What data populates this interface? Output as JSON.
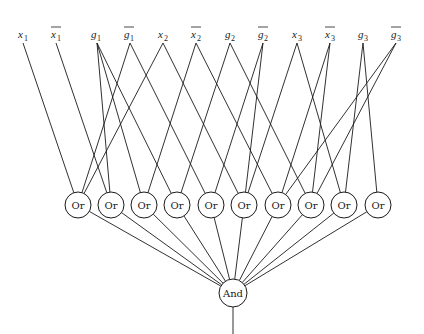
{
  "diagram": {
    "type": "boolean-circuit",
    "stroke_color": "#1a1a1a",
    "background": "#ffffff",
    "inputs": [
      {
        "id": "x1",
        "base": "x",
        "sub": "1",
        "negated": false,
        "x": 23,
        "label_x": 22
      },
      {
        "id": "nx1",
        "base": "x",
        "sub": "1",
        "negated": true,
        "x": 56,
        "label_x": 55
      },
      {
        "id": "g1",
        "base": "g",
        "sub": "1",
        "negated": false,
        "x": 97,
        "label_x": 95
      },
      {
        "id": "ng1",
        "base": "g",
        "sub": "1",
        "negated": true,
        "x": 130,
        "label_x": 128
      },
      {
        "id": "x2",
        "base": "x",
        "sub": "2",
        "negated": false,
        "x": 163,
        "label_x": 162
      },
      {
        "id": "nx2",
        "base": "x",
        "sub": "2",
        "negated": true,
        "x": 196,
        "label_x": 195
      },
      {
        "id": "g2",
        "base": "g",
        "sub": "2",
        "negated": false,
        "x": 230,
        "label_x": 229
      },
      {
        "id": "ng2",
        "base": "g",
        "sub": "2",
        "negated": true,
        "x": 263,
        "label_x": 262
      },
      {
        "id": "x3",
        "base": "x",
        "sub": "3",
        "negated": false,
        "x": 297,
        "label_x": 296
      },
      {
        "id": "nx3",
        "base": "x",
        "sub": "3",
        "negated": true,
        "x": 330,
        "label_x": 329
      },
      {
        "id": "g3",
        "base": "g",
        "sub": "3",
        "negated": false,
        "x": 363,
        "label_x": 362
      },
      {
        "id": "ng3",
        "base": "g",
        "sub": "3",
        "negated": true,
        "x": 396,
        "label_x": 395
      }
    ],
    "input_label_y": 38,
    "input_wire_y": 43,
    "or_gates": [
      {
        "id": "or1",
        "label": "Or",
        "cx": 78
      },
      {
        "id": "or2",
        "label": "Or",
        "cx": 111
      },
      {
        "id": "or3",
        "label": "Or",
        "cx": 144
      },
      {
        "id": "or4",
        "label": "Or",
        "cx": 177
      },
      {
        "id": "or5",
        "label": "Or",
        "cx": 211
      },
      {
        "id": "or6",
        "label": "Or",
        "cx": 244
      },
      {
        "id": "or7",
        "label": "Or",
        "cx": 278
      },
      {
        "id": "or8",
        "label": "Or",
        "cx": 311
      },
      {
        "id": "or9",
        "label": "Or",
        "cx": 344
      },
      {
        "id": "or10",
        "label": "Or",
        "cx": 378
      }
    ],
    "or_cy": 205,
    "gate_r": 13,
    "and_gate": {
      "id": "and",
      "label": "And",
      "cx": 233,
      "cy": 293,
      "r": 14
    },
    "output_end_y": 334,
    "edges": [
      [
        "x1",
        "or1"
      ],
      [
        "nx1",
        "or2"
      ],
      [
        "g1",
        "or2"
      ],
      [
        "g1",
        "or3"
      ],
      [
        "g1",
        "or4"
      ],
      [
        "ng1",
        "or1"
      ],
      [
        "ng1",
        "or5"
      ],
      [
        "x2",
        "or1"
      ],
      [
        "x2",
        "or6"
      ],
      [
        "nx2",
        "or3"
      ],
      [
        "nx2",
        "or7"
      ],
      [
        "g2",
        "or4"
      ],
      [
        "g2",
        "or8"
      ],
      [
        "ng2",
        "or5"
      ],
      [
        "ng2",
        "or6"
      ],
      [
        "x3",
        "or6"
      ],
      [
        "x3",
        "or9"
      ],
      [
        "nx3",
        "or7"
      ],
      [
        "nx3",
        "or8"
      ],
      [
        "g3",
        "or9"
      ],
      [
        "g3",
        "or10"
      ],
      [
        "ng3",
        "or7"
      ],
      [
        "ng3",
        "or8"
      ]
    ]
  }
}
